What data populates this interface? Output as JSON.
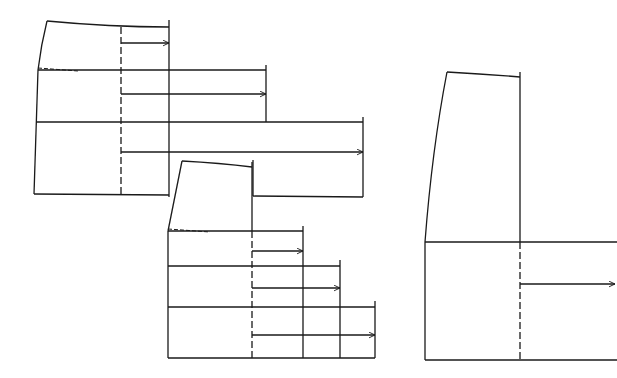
{
  "diagram": {
    "type": "pattern-drafting",
    "stroke_color": "#1a1a1a",
    "background": "#ffffff",
    "pieces": [
      {
        "id": "piece-1",
        "waist": {
          "left": [
            47,
            21
          ],
          "right": [
            169,
            27
          ]
        },
        "hip_curve_left": [
          [
            47,
            21
          ],
          [
            41,
            45
          ],
          [
            38,
            70
          ]
        ],
        "left_bottom": [
          34,
          194
        ],
        "hip_dash": {
          "from": [
            38,
            68
          ],
          "to": [
            78,
            71
          ]
        },
        "dashed_slash_x": 121,
        "dashed_range": [
          27,
          194
        ],
        "tiers": [
          {
            "line_y": 70,
            "end_x": 266,
            "vert_x": 169,
            "vert_from": 20,
            "vert_to": 70,
            "arrow_y": 43,
            "arrow_to": 169
          },
          {
            "line_y": 122,
            "end_x": 363,
            "vert_x": 266,
            "vert_from": 65,
            "vert_to": 122,
            "arrow_y": 94,
            "arrow_to": 266
          },
          {
            "line_y": 194,
            "end_x": 169,
            "vert_x": 363,
            "vert_from": 117,
            "vert_to": 197,
            "arrow_y": 152,
            "arrow_to": 363
          }
        ],
        "inner_vertical_x": 169,
        "bottom_y": 194,
        "bottom_right_x": 169
      },
      {
        "id": "piece-2",
        "waist": {
          "left": [
            182,
            161
          ],
          "right": [
            252,
            167
          ]
        },
        "left_hip": [
          168,
          231
        ],
        "left_bottom": [
          168,
          358
        ],
        "hip_dash": {
          "from": [
            168,
            229
          ],
          "to": [
            210,
            232
          ]
        },
        "dashed_slash_x": 252,
        "dashed_range": [
          231,
          358
        ],
        "tiers": [
          {
            "line_y": 231,
            "end_x": 303,
            "vert_x": 303,
            "vert_from": 226,
            "vert_to": 358,
            "arrow_y": 251,
            "arrow_to": 303
          },
          {
            "line_y": 266,
            "end_x": 340,
            "vert_x": 340,
            "vert_from": 260,
            "vert_to": 358,
            "arrow_y": 288,
            "arrow_to": 340
          },
          {
            "line_y": 307,
            "end_x": 375,
            "vert_x": 375,
            "vert_from": 301,
            "vert_to": 358,
            "arrow_y": 335,
            "arrow_to": 375
          }
        ],
        "bottom_y": 358,
        "bottom_right_x": 375
      },
      {
        "id": "piece-3",
        "waist": {
          "left": [
            447,
            72
          ],
          "right": [
            520,
            77
          ]
        },
        "left_curve": [
          [
            447,
            72
          ],
          [
            432,
            150
          ],
          [
            425,
            242
          ]
        ],
        "left_bottom": [
          425,
          360
        ],
        "right_vertical_x": 520,
        "hip_y": 242,
        "hip_end_x": 617,
        "dashed_slash_x": 520,
        "dashed_range": [
          242,
          360
        ],
        "arrow": {
          "y": 284,
          "from": 520,
          "to": 615
        },
        "bottom_y": 360,
        "bottom_end_x": 617
      }
    ]
  }
}
